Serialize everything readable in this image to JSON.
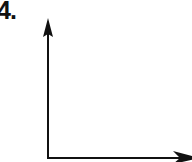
{
  "problem": {
    "number_label": "4."
  },
  "diagram": {
    "type": "coordinate-axes",
    "origin": [
      48,
      158
    ],
    "y_axis_tip": [
      48,
      18
    ],
    "x_axis_tip": [
      198,
      158
    ],
    "stroke_color": "#111111",
    "axis_labels": []
  }
}
